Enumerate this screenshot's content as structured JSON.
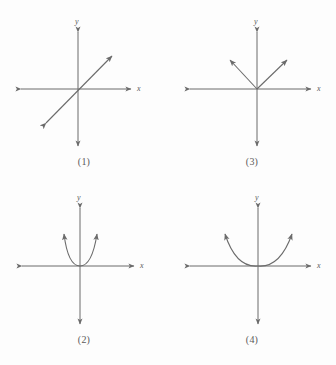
{
  "figure": {
    "title": "",
    "stroke_color": "#6b6b6b",
    "background_color": "#fdfdfd",
    "panels": [
      {
        "id": "panel-1",
        "caption": "(1)",
        "x_axis_label": "x",
        "y_axis_label": "y",
        "graph_type": "line",
        "description": "straight line through the origin with positive slope, double arrowheads"
      },
      {
        "id": "panel-3",
        "caption": "(3)",
        "x_axis_label": "x",
        "y_axis_label": "y",
        "graph_type": "absolute-value",
        "description": "V shape opening upward with vertex at the origin"
      },
      {
        "id": "panel-2",
        "caption": "(2)",
        "x_axis_label": "x",
        "y_axis_label": "y",
        "graph_type": "parabola-narrow",
        "description": "narrow parabola opening upward with vertex at the origin"
      },
      {
        "id": "panel-4",
        "caption": "(4)",
        "x_axis_label": "x",
        "y_axis_label": "y",
        "graph_type": "parabola-wide",
        "description": "wide parabola opening upward with vertex at the origin"
      }
    ]
  }
}
